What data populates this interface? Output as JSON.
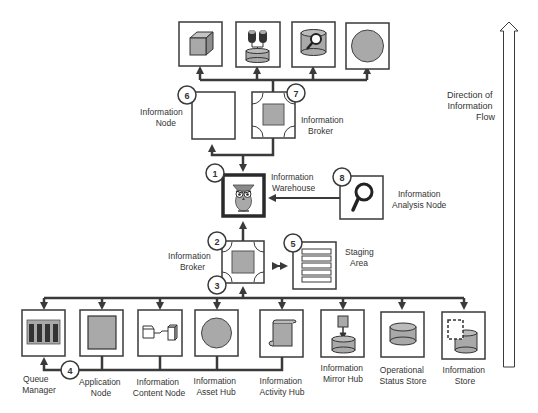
{
  "diagram": {
    "colors": {
      "line": "#3a3a3a",
      "fill": "#a9a9a9",
      "dark": "#3c3c3c",
      "background": "#ffffff"
    },
    "flow_arrow": {
      "label_lines": [
        "Direction of",
        "Information",
        "Flow"
      ]
    },
    "nodes": {
      "warehouse": {
        "number": "1",
        "label_lines": [
          "Information",
          "Warehouse"
        ],
        "icon": "owl-icon"
      },
      "broker_lower": {
        "number": "2",
        "label_lines": [
          "Information",
          "Broker"
        ],
        "icon": "broker-icon"
      },
      "bus_marker": {
        "number": "3"
      },
      "queue_marker": {
        "number": "4"
      },
      "staging": {
        "number": "5",
        "label_lines": [
          "Staging",
          "Area"
        ],
        "icon": "staging-list-icon"
      },
      "info_node": {
        "number": "6",
        "label_lines": [
          "Information",
          "Node"
        ],
        "icon": "empty-box"
      },
      "broker_upper": {
        "number": "7",
        "label_lines": [
          "Information",
          "Broker"
        ],
        "icon": "broker-icon"
      },
      "analysis": {
        "number": "8",
        "label_lines": [
          "Information",
          "Analysis Node"
        ],
        "icon": "magnifier-icon"
      }
    },
    "top_row": [
      {
        "icon": "cube-icon"
      },
      {
        "icon": "people-database-icon"
      },
      {
        "icon": "database-search-icon"
      },
      {
        "icon": "circle-icon"
      }
    ],
    "bottom_row": [
      {
        "label_lines": [
          "Queue",
          "Manager"
        ],
        "icon": "queue-icon"
      },
      {
        "label_lines": [
          "Application",
          "Node"
        ],
        "icon": "application-icon"
      },
      {
        "label_lines": [
          "Information",
          "Content Node"
        ],
        "icon": "content-node-icon"
      },
      {
        "label_lines": [
          "Information",
          "Asset Hub"
        ],
        "icon": "circle-icon"
      },
      {
        "label_lines": [
          "Information",
          "Activity Hub"
        ],
        "icon": "scroll-icon"
      },
      {
        "label_lines": [
          "Information",
          "Mirror Hub"
        ],
        "icon": "mirror-database-icon"
      },
      {
        "label_lines": [
          "Operational",
          "Status Store"
        ],
        "icon": "database-icon"
      },
      {
        "label_lines": [
          "Information",
          "Store"
        ],
        "icon": "store-icon"
      }
    ]
  }
}
